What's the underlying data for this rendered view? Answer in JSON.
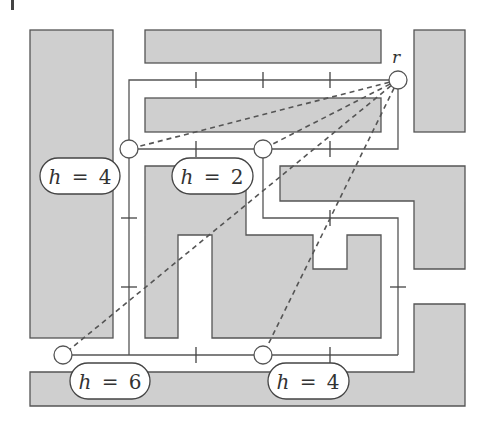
{
  "figure": {
    "type": "grid-graph-line-of-sight-diagram",
    "colors": {
      "obstacle_fill": "#cfcfcf",
      "obstacle_stroke": "#555555",
      "path_stroke": "#555555",
      "background": "#ffffff"
    },
    "root_node": {
      "label": "r",
      "x": 398,
      "y": 80
    },
    "nodes": [
      {
        "id": "n1",
        "x": 129,
        "y": 149,
        "label": "h = 4"
      },
      {
        "id": "n2",
        "x": 263,
        "y": 149,
        "label": "h = 2"
      },
      {
        "id": "n3",
        "x": 63,
        "y": 355,
        "label": "h = 6"
      },
      {
        "id": "n4",
        "x": 263,
        "y": 355,
        "label": "h = 4"
      }
    ],
    "labels": {
      "h4_top": {
        "var": "h",
        "eq": "=",
        "value": "4"
      },
      "h2_top": {
        "var": "h",
        "eq": "=",
        "value": "2"
      },
      "h6_bottom": {
        "var": "h",
        "eq": "=",
        "value": "6"
      },
      "h4_bottom": {
        "var": "h",
        "eq": "=",
        "value": "4"
      }
    }
  }
}
